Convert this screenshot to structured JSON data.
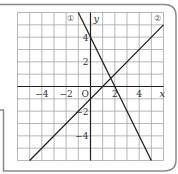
{
  "figure": {
    "type": "coordinate-plane-with-two-lines",
    "axes": {
      "x_label": "x",
      "y_label": "y",
      "origin_label": "O",
      "x_range": [
        -6,
        6
      ],
      "y_range": [
        -6,
        6
      ],
      "grid": true,
      "grid_step": 1,
      "x_tick_labels": [
        {
          "value": -4,
          "text": "−4"
        },
        {
          "value": -2,
          "text": "−2"
        },
        {
          "value": 2,
          "text": "2"
        },
        {
          "value": 4,
          "text": "4"
        }
      ],
      "y_tick_labels": [
        {
          "value": 4,
          "text": "4"
        },
        {
          "value": 2,
          "text": "2"
        },
        {
          "value": -2,
          "text": "−2"
        },
        {
          "value": -4,
          "text": "−4"
        }
      ]
    },
    "lines": [
      {
        "id": "line-1",
        "label": "①",
        "equation": "y = -2x + 4",
        "slope": -2,
        "intercept": 4,
        "color": "#222222"
      },
      {
        "id": "line-2",
        "label": "②",
        "equation": "y = x - 1",
        "slope": 1,
        "intercept": -1,
        "color": "#222222"
      }
    ],
    "colors": {
      "grid": "#9a9a9a",
      "axis": "#222222",
      "frame": "#8a8a8a",
      "line": "#222222"
    }
  }
}
